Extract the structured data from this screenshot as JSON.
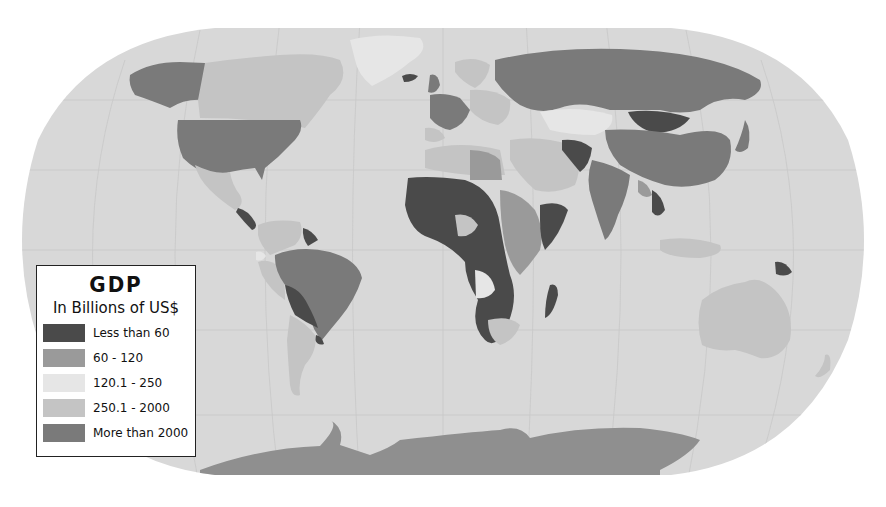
{
  "map": {
    "title": "GDP",
    "subtitle": "In Billions of US$",
    "projection": "Robinson-like world map",
    "ocean_color": "#d8d8d8",
    "antarctica_color": "#8f8f8f",
    "legend": {
      "items": [
        {
          "label": "Less than 60",
          "color": "#4a4a4a"
        },
        {
          "label": "60 - 120",
          "color": "#9a9a9a"
        },
        {
          "label": "120.1 - 250",
          "color": "#e6e6e6"
        },
        {
          "label": "250.1 - 2000",
          "color": "#c4c4c4"
        },
        {
          "label": "More than 2000",
          "color": "#7a7a7a"
        }
      ]
    },
    "regions": [
      {
        "name": "United States",
        "category": "More than 2000"
      },
      {
        "name": "Canada",
        "category": "250.1 - 2000"
      },
      {
        "name": "Alaska",
        "category": "More than 2000"
      },
      {
        "name": "Greenland",
        "category": "120.1 - 250"
      },
      {
        "name": "Mexico",
        "category": "250.1 - 2000"
      },
      {
        "name": "Brazil",
        "category": "More than 2000"
      },
      {
        "name": "Bolivia/Paraguay",
        "category": "Less than 60"
      },
      {
        "name": "Argentina",
        "category": "250.1 - 2000"
      },
      {
        "name": "Russia",
        "category": "More than 2000"
      },
      {
        "name": "China",
        "category": "More than 2000"
      },
      {
        "name": "India",
        "category": "More than 2000"
      },
      {
        "name": "Mongolia",
        "category": "Less than 60"
      },
      {
        "name": "Kazakhstan",
        "category": "120.1 - 250"
      },
      {
        "name": "West/Central Africa",
        "category": "Less than 60"
      },
      {
        "name": "East Africa",
        "category": "60 - 120"
      },
      {
        "name": "South Africa",
        "category": "250.1 - 2000"
      },
      {
        "name": "Angola",
        "category": "120.1 - 250"
      },
      {
        "name": "Madagascar",
        "category": "Less than 60"
      },
      {
        "name": "Australia",
        "category": "250.1 - 2000"
      },
      {
        "name": "Papua New Guinea",
        "category": "Less than 60"
      },
      {
        "name": "Antarctica",
        "category": "More than 2000"
      }
    ]
  }
}
